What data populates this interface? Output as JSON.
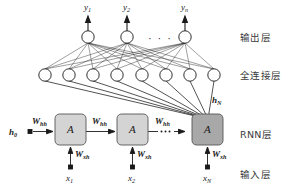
{
  "figure": {
    "type": "neural-network-architecture"
  },
  "layer_labels": {
    "output": "输出层",
    "fully_connected": "全连接层",
    "rnn": "RNN层",
    "input": "输入层"
  },
  "output_nodes": [
    {
      "label": "y",
      "sub": "1"
    },
    {
      "label": "y",
      "sub": "2"
    },
    {
      "label": "y",
      "sub": "n"
    }
  ],
  "output_ellipsis": "· · ·",
  "input_nodes": [
    {
      "label": "x",
      "sub": "1"
    },
    {
      "label": "x",
      "sub": "2"
    },
    {
      "label": "x",
      "sub": "N"
    }
  ],
  "rnn_cells": [
    {
      "label": "A",
      "shade": "#d4d4d4"
    },
    {
      "label": "A",
      "shade": "#d4d4d4"
    },
    {
      "label": "A",
      "shade": "#a8a8a8"
    }
  ],
  "initial_state": {
    "label": "h",
    "sub": "0"
  },
  "final_state": {
    "label": "h",
    "sub": "N"
  },
  "recurrent_weights": [
    {
      "label": "W",
      "sub": "hh"
    },
    {
      "label": "W",
      "sub": "hh"
    },
    {
      "label": "W",
      "sub": "hh"
    }
  ],
  "input_weights": [
    {
      "label": "W",
      "sub": "xh"
    },
    {
      "label": "W",
      "sub": "xh"
    },
    {
      "label": "W",
      "sub": "xh"
    }
  ],
  "fc_node_count": 8,
  "colors": {
    "stroke": "#1a1a1a",
    "cell_light": "#d4d4d4",
    "cell_dark": "#a8a8a8",
    "cell_border": "#555555",
    "text": "#1a1a1a",
    "label_text": "#3a3a3a",
    "background": "#ffffff"
  }
}
